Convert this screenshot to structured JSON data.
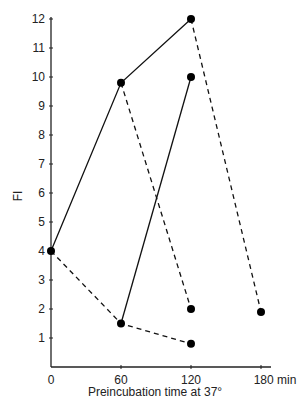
{
  "chart_data": {
    "type": "line",
    "title": "",
    "xlabel": "Preincubation time at 37°",
    "ylabel": "FI",
    "x_unit": "min",
    "xlim": [
      0,
      180
    ],
    "ylim": [
      0,
      12
    ],
    "x_ticks": [
      "0",
      "60",
      "120",
      "180 min"
    ],
    "x_tick_values": [
      0,
      60,
      120,
      180
    ],
    "y_ticks": [
      "1",
      "2",
      "3",
      "4",
      "5",
      "6",
      "7",
      "8",
      "9",
      "10",
      "11",
      "12"
    ],
    "y_tick_values": [
      1,
      2,
      3,
      4,
      5,
      6,
      7,
      8,
      9,
      10,
      11,
      12
    ],
    "grid": false,
    "legend": "none",
    "series": [
      {
        "name": "solid segment A",
        "style": "solid",
        "points": [
          {
            "x": 0,
            "y": 4.0
          },
          {
            "x": 60,
            "y": 9.8
          },
          {
            "x": 120,
            "y": 12.0
          }
        ]
      },
      {
        "name": "solid segment B",
        "style": "solid",
        "points": [
          {
            "x": 60,
            "y": 1.5
          },
          {
            "x": 120,
            "y": 10.0
          }
        ]
      },
      {
        "name": "dashed segment 1",
        "style": "dashed",
        "points": [
          {
            "x": 0,
            "y": 4.0
          },
          {
            "x": 60,
            "y": 1.5
          },
          {
            "x": 120,
            "y": 0.8
          }
        ]
      },
      {
        "name": "dashed segment 2",
        "style": "dashed",
        "points": [
          {
            "x": 60,
            "y": 9.8
          },
          {
            "x": 120,
            "y": 2.0
          }
        ]
      },
      {
        "name": "dashed segment 3",
        "style": "dashed",
        "points": [
          {
            "x": 120,
            "y": 12.0
          },
          {
            "x": 180,
            "y": 1.9
          }
        ]
      }
    ],
    "markers": [
      {
        "x": 0,
        "y": 4.0
      },
      {
        "x": 60,
        "y": 9.8
      },
      {
        "x": 120,
        "y": 12.0
      },
      {
        "x": 60,
        "y": 1.5
      },
      {
        "x": 120,
        "y": 10.0
      },
      {
        "x": 120,
        "y": 2.0
      },
      {
        "x": 120,
        "y": 0.8
      },
      {
        "x": 180,
        "y": 1.9
      }
    ],
    "colors": {
      "line": "#111111",
      "marker": "#000000",
      "axis": "#222222"
    }
  }
}
